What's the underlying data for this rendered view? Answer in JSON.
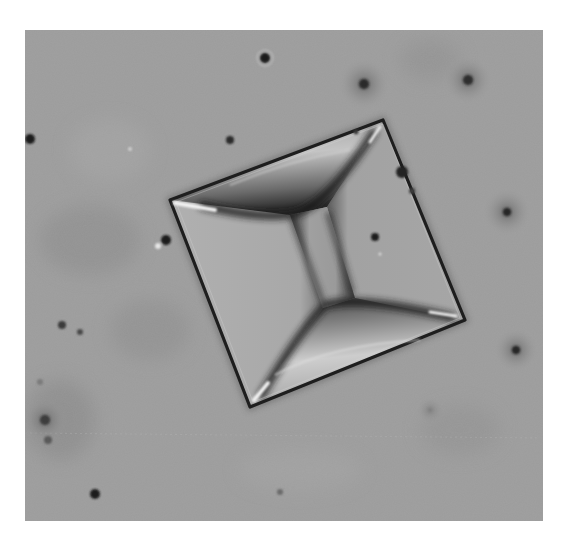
{
  "figure": {
    "type": "micrograph",
    "colors": {
      "page_background": "#ffffff",
      "image_background": "#9c9c9c",
      "crystal_face": "#a8a8a8",
      "edge_dark": "#1e1e1e",
      "highlight": "#f0f0f0"
    },
    "crystal": {
      "outer_corners": [
        [
          383,
          120
        ],
        [
          170,
          200
        ],
        [
          250,
          407
        ],
        [
          465,
          320
        ]
      ],
      "inner_neck_corners": [
        [
          290,
          215
        ],
        [
          327,
          207
        ],
        [
          355,
          298
        ],
        [
          323,
          308
        ]
      ]
    },
    "particles": [
      {
        "x": 265,
        "y": 58,
        "r": 5
      },
      {
        "x": 364,
        "y": 84,
        "r": 5
      },
      {
        "x": 468,
        "y": 80,
        "r": 5
      },
      {
        "x": 30,
        "y": 139,
        "r": 6
      },
      {
        "x": 230,
        "y": 140,
        "r": 4
      },
      {
        "x": 166,
        "y": 240,
        "r": 5
      },
      {
        "x": 507,
        "y": 212,
        "r": 5
      },
      {
        "x": 516,
        "y": 350,
        "r": 5
      },
      {
        "x": 62,
        "y": 325,
        "r": 4
      },
      {
        "x": 80,
        "y": 332,
        "r": 3
      },
      {
        "x": 45,
        "y": 420,
        "r": 6
      },
      {
        "x": 95,
        "y": 494,
        "r": 5
      },
      {
        "x": 375,
        "y": 237,
        "r": 4
      },
      {
        "x": 402,
        "y": 172,
        "r": 6
      }
    ]
  }
}
